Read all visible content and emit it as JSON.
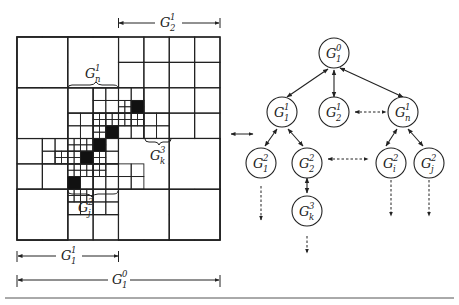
{
  "figure": {
    "grid_labels": {
      "gn1": {
        "base": "G",
        "sup": "1",
        "sub": "n"
      },
      "gk3": {
        "base": "G",
        "sup": "3",
        "sub": "k"
      },
      "gj2": {
        "base": "G",
        "sup": "2",
        "sub": "j"
      }
    },
    "dimension_labels": {
      "top": {
        "base": "G",
        "sup": "1",
        "sub": "2"
      },
      "bottom_half": {
        "base": "G",
        "sup": "1",
        "sub": "1"
      },
      "bottom_full": {
        "base": "G",
        "sup": "0",
        "sub": "1"
      }
    },
    "tree_nodes": [
      {
        "id": "root",
        "base": "G",
        "sup": "0",
        "sub": "1"
      },
      {
        "id": "g11",
        "base": "G",
        "sup": "1",
        "sub": "1"
      },
      {
        "id": "g12",
        "base": "G",
        "sup": "1",
        "sub": "2"
      },
      {
        "id": "g1n",
        "base": "G",
        "sup": "1",
        "sub": "n"
      },
      {
        "id": "g21",
        "base": "G",
        "sup": "2",
        "sub": "1"
      },
      {
        "id": "g22",
        "base": "G",
        "sup": "2",
        "sub": "2"
      },
      {
        "id": "g2i",
        "base": "G",
        "sup": "2",
        "sub": "i"
      },
      {
        "id": "g2j",
        "base": "G",
        "sup": "2",
        "sub": "j"
      },
      {
        "id": "g3k",
        "base": "G",
        "sup": "3",
        "sub": "k"
      }
    ]
  }
}
